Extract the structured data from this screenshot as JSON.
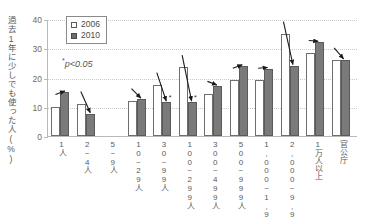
{
  "chart_data": {
    "type": "bar",
    "title": "",
    "xlabel": "",
    "ylabel": "過去1年に少しでも使った人(%)",
    "ylim": [
      0,
      40
    ],
    "yticks": [
      0,
      10,
      20,
      30,
      40
    ],
    "grid": true,
    "legend_position": "top-left",
    "annotation": "p<0.05",
    "annotation_star": "*",
    "categories": [
      "1人",
      "2~4人",
      "5~9人",
      "10~29人",
      "30~99人",
      "100~299人",
      "300~499人",
      "500~999人",
      "1,000~1,999人",
      "2,000~9,999人",
      "1万人以上",
      "官公庁"
    ],
    "series": [
      {
        "name": "2006",
        "values": [
          10.0,
          11.0,
          0,
          12.0,
          17.5,
          23.5,
          14.5,
          19.0,
          19.0,
          35.0,
          28.5,
          26.0
        ]
      },
      {
        "name": "2010",
        "values": [
          15.0,
          7.5,
          0,
          12.5,
          11.5,
          11.5,
          17.0,
          24.0,
          23.0,
          24.0,
          32.0,
          26.0
        ]
      }
    ],
    "change_arrows": [
      {
        "category": "1人",
        "direction": "up",
        "significant": false
      },
      {
        "category": "2~4人",
        "direction": "down",
        "significant": false
      },
      {
        "category": "5~9人",
        "direction": "none",
        "significant": false
      },
      {
        "category": "10~29人",
        "direction": "up",
        "significant": false
      },
      {
        "category": "30~99人",
        "direction": "down",
        "significant": true
      },
      {
        "category": "100~299人",
        "direction": "down",
        "significant": true
      },
      {
        "category": "300~499人",
        "direction": "up",
        "significant": false
      },
      {
        "category": "500~999人",
        "direction": "up",
        "significant": false
      },
      {
        "category": "1,000~1,999人",
        "direction": "up",
        "significant": false
      },
      {
        "category": "2,000~9,999人",
        "direction": "down",
        "significant": false
      },
      {
        "category": "1万人以上",
        "direction": "down",
        "significant": false
      },
      {
        "category": "官公庁",
        "direction": "down",
        "significant": false
      }
    ]
  },
  "legend": {
    "items": [
      {
        "label": "2006",
        "color": "#ffffff"
      },
      {
        "label": "2010",
        "color": "#7a7a7a"
      }
    ]
  },
  "axis": {
    "tick_40": "40",
    "tick_30": "30",
    "tick_20": "20",
    "tick_10": "10",
    "tick_0": "0"
  }
}
